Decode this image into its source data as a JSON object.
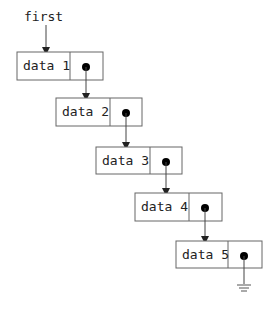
{
  "diagram": {
    "type": "singly-linked-list",
    "head_label": "first",
    "nodes": [
      {
        "data": "data 1",
        "next": "pointer"
      },
      {
        "data": "data 2",
        "next": "pointer"
      },
      {
        "data": "data 3",
        "next": "pointer"
      },
      {
        "data": "data 4",
        "next": "pointer"
      },
      {
        "data": "data 5",
        "next": "null"
      }
    ],
    "terminator_icon": "ground-icon"
  },
  "colors": {
    "stroke": "#555555",
    "text": "#222222",
    "pointer_dot": "#000000",
    "background": "#ffffff"
  }
}
